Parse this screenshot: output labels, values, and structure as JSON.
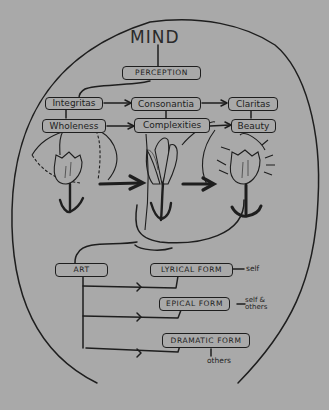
{
  "diagram": {
    "title": "MIND",
    "background_color": "#a9a9a9",
    "ink_color": "#1e1e1e",
    "perception": "PERCEPTION",
    "row1": [
      "Integritas",
      "Consonantia",
      "Claritas"
    ],
    "row2": [
      "Wholeness",
      "Complexities",
      "Beauty"
    ],
    "art": "ART",
    "forms": [
      {
        "label": "LYRICAL FORM",
        "note": "self"
      },
      {
        "label": "EPICAL FORM",
        "note": "self & others"
      },
      {
        "label": "DRAMATIC FORM",
        "note": "others"
      }
    ],
    "flowers": [
      "closed-tulip",
      "opening-tulip",
      "radiant-tulip"
    ]
  }
}
